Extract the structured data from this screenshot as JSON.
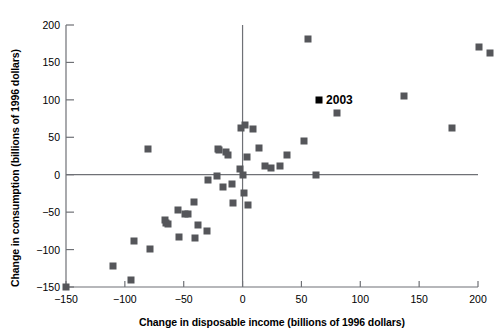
{
  "chart_data": {
    "type": "scatter",
    "title": "",
    "xlabel": "Change in disposable income (billions of 1996 dollars)",
    "ylabel": "Change in consumption (billions of 1996 dollars)",
    "xlim": [
      -150,
      200
    ],
    "ylim": [
      -150,
      200
    ],
    "xticks": [
      -150,
      -100,
      -50,
      0,
      50,
      100,
      150,
      200
    ],
    "yticks": [
      -150,
      -100,
      -50,
      0,
      50,
      100,
      150,
      200
    ],
    "xtick_labels": [
      "−150",
      "−100",
      "−50",
      "0",
      "50",
      "100",
      "150",
      "200"
    ],
    "ytick_labels": [
      "−150",
      "−100",
      "−50",
      "0",
      "50",
      "100",
      "150",
      "200"
    ],
    "grid": false,
    "zero_lines": true,
    "marker_color": "#55565a",
    "highlight_color": "#000000",
    "legend": null,
    "annotations": [
      {
        "text": "2003",
        "x": 65,
        "y": 100
      }
    ],
    "series": [
      {
        "name": "Annual change in disposable income vs consumption",
        "points": [
          {
            "x": -150,
            "y": -150
          },
          {
            "x": -110,
            "y": -122
          },
          {
            "x": -95,
            "y": -141
          },
          {
            "x": -92,
            "y": -88
          },
          {
            "x": -80,
            "y": 35
          },
          {
            "x": -79,
            "y": -99
          },
          {
            "x": -66,
            "y": -61
          },
          {
            "x": -65,
            "y": -64
          },
          {
            "x": -63,
            "y": -66
          },
          {
            "x": -55,
            "y": -47
          },
          {
            "x": -54,
            "y": -83
          },
          {
            "x": -49,
            "y": -52
          },
          {
            "x": -46,
            "y": -52
          },
          {
            "x": -41,
            "y": -37
          },
          {
            "x": -40,
            "y": -84
          },
          {
            "x": -38,
            "y": -67
          },
          {
            "x": -30,
            "y": -75
          },
          {
            "x": -29,
            "y": -7
          },
          {
            "x": -22,
            "y": -2
          },
          {
            "x": -21,
            "y": 35
          },
          {
            "x": -20,
            "y": 33
          },
          {
            "x": -17,
            "y": -17
          },
          {
            "x": -14,
            "y": 30
          },
          {
            "x": -12,
            "y": 27
          },
          {
            "x": -9,
            "y": -13
          },
          {
            "x": -8,
            "y": -38
          },
          {
            "x": -2,
            "y": 8
          },
          {
            "x": -1,
            "y": 62
          },
          {
            "x": 0,
            "y": -1
          },
          {
            "x": 1,
            "y": -25
          },
          {
            "x": 2,
            "y": 67
          },
          {
            "x": 4,
            "y": 24
          },
          {
            "x": 5,
            "y": -40
          },
          {
            "x": 9,
            "y": 61
          },
          {
            "x": 14,
            "y": 36
          },
          {
            "x": 19,
            "y": 11
          },
          {
            "x": 24,
            "y": 9
          },
          {
            "x": 32,
            "y": 12
          },
          {
            "x": 38,
            "y": 26
          },
          {
            "x": 52,
            "y": 45
          },
          {
            "x": 56,
            "y": 181
          },
          {
            "x": 62,
            "y": -1
          },
          {
            "x": 65,
            "y": 100,
            "highlight": true,
            "label": "2003"
          },
          {
            "x": 80,
            "y": 83
          },
          {
            "x": 137,
            "y": 105
          },
          {
            "x": 178,
            "y": 63
          },
          {
            "x": 201,
            "y": 170
          },
          {
            "x": 210,
            "y": 163
          }
        ]
      }
    ]
  }
}
